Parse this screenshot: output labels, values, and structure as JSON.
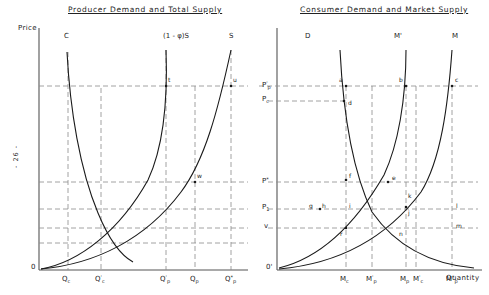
{
  "page": {
    "number_marker": "- 26 -"
  },
  "panels": [
    {
      "id": "left",
      "title": "Producer Demand and Total Supply",
      "y_axis_label": "Price",
      "origin_label": "0",
      "curve_labels": [
        {
          "name": "C",
          "text": "C"
        },
        {
          "name": "phi-S",
          "text": "(1 - φ)S"
        },
        {
          "name": "S",
          "text": "S"
        }
      ],
      "point_labels": [
        {
          "name": "t",
          "text": "t"
        },
        {
          "name": "u",
          "text": "u"
        },
        {
          "name": "w",
          "text": "w"
        }
      ],
      "x_ticks": [
        {
          "name": "Qc",
          "base": "Q",
          "sub": "c",
          "sup": ""
        },
        {
          "name": "Qc-prime",
          "base": "Q",
          "sub": "c",
          "sup": "'"
        },
        {
          "name": "Qp-prime",
          "base": "Q",
          "sub": "p",
          "sup": "'"
        },
        {
          "name": "Qp",
          "base": "Q",
          "sub": "p",
          "sup": ""
        },
        {
          "name": "Qp-star",
          "base": "Q",
          "sub": "p",
          "sup": "*"
        }
      ]
    },
    {
      "id": "right",
      "title": "Consumer Demand and Market Supply",
      "origin_label": "0'",
      "x_axis_label": "Quantity",
      "curve_labels": [
        {
          "name": "D",
          "text": "D"
        },
        {
          "name": "M-prime",
          "text": "M'"
        },
        {
          "name": "M",
          "text": "M"
        }
      ],
      "y_ticks": [
        {
          "name": "Pp-prime",
          "base": "P",
          "sub": "p",
          "sup": "'"
        },
        {
          "name": "Pc",
          "base": "P",
          "sub": "c",
          "sup": ""
        },
        {
          "name": "P-star",
          "base": "P",
          "sub": "",
          "sup": "*"
        },
        {
          "name": "P1",
          "base": "P",
          "sub": "1",
          "sup": ""
        },
        {
          "name": "v",
          "base": "v",
          "sub": "",
          "sup": ""
        }
      ],
      "point_labels": [
        {
          "name": "a",
          "text": "a"
        },
        {
          "name": "b",
          "text": "b"
        },
        {
          "name": "c",
          "text": "c"
        },
        {
          "name": "d",
          "text": "d"
        },
        {
          "name": "e",
          "text": "e"
        },
        {
          "name": "f",
          "text": "f"
        },
        {
          "name": "g",
          "text": "g"
        },
        {
          "name": "h",
          "text": "h"
        },
        {
          "name": "i",
          "text": "i"
        },
        {
          "name": "j",
          "text": "j"
        },
        {
          "name": "k",
          "text": "k"
        },
        {
          "name": "l",
          "text": "l"
        },
        {
          "name": "m",
          "text": "m"
        },
        {
          "name": "n",
          "text": "n"
        },
        {
          "name": "r",
          "text": "r"
        }
      ],
      "x_ticks": [
        {
          "name": "Mc",
          "base": "M",
          "sub": "c",
          "sup": ""
        },
        {
          "name": "Mp-prime",
          "base": "M",
          "sub": "p",
          "sup": "'"
        },
        {
          "name": "Mp",
          "base": "M",
          "sub": "p",
          "sup": ""
        },
        {
          "name": "Mc-prime",
          "base": "M",
          "sub": "c",
          "sup": "'"
        },
        {
          "name": "Mp-star",
          "base": "M",
          "sub": "p",
          "sup": "*"
        }
      ]
    }
  ],
  "colors": {
    "axis": "#555555",
    "curve": "#1a1a1a",
    "guide": "#8a8a8a",
    "text": "#222222",
    "background": "#ffffff"
  }
}
